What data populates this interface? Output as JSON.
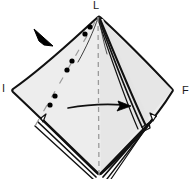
{
  "figure": {
    "type": "origami-fold-diagram",
    "background_color": "#ffffff",
    "paper_fill_color": "#ededed",
    "paper_fill_shadow_color": "#e0e0e0",
    "line_color": "#111111",
    "dashed_line_color": "#8a8a8a",
    "dot_color": "#000000"
  },
  "labels": {
    "top": "L",
    "left": "I",
    "right": "F"
  },
  "vertices": {
    "top": {
      "x": 98,
      "y": 17
    },
    "left": {
      "x": 12,
      "y": 90
    },
    "right": {
      "x": 172,
      "y": 92
    },
    "bottom": {
      "x": 99,
      "y": 172
    }
  },
  "fold_lines": {
    "center_vertical": {
      "name": "center-crease",
      "style": "dashed",
      "from": {
        "x": 98,
        "y": 17
      },
      "to": {
        "x": 99,
        "y": 176
      }
    },
    "diagonal_chain": {
      "name": "diagonal-fold-crease",
      "style": "dash-dot",
      "from": {
        "x": 95,
        "y": 22
      },
      "to": {
        "x": 35,
        "y": 124
      },
      "dot_count": 6
    }
  },
  "arrows": {
    "pointer_arrowhead": {
      "name": "fold-direction-arrowhead",
      "description": "solid black triangular arrowhead pointing down-right",
      "tip": {
        "x": 52,
        "y": 45
      },
      "rotation_deg": 38
    },
    "motion_arrow": {
      "name": "fold-motion-arrow",
      "description": "horizontal arrow pointing right",
      "from": {
        "x": 68,
        "y": 108
      },
      "to": {
        "x": 131,
        "y": 106
      },
      "direction": "right"
    }
  },
  "layers": {
    "description": "stacked paper edges visible along lower edges",
    "bottom_left_count": 3,
    "bottom_right_count": 4,
    "right_flap_count": 2
  }
}
